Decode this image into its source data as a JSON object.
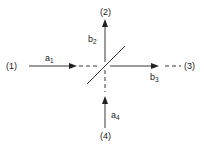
{
  "diagram": {
    "ports": [
      {
        "id": "port-1",
        "label": "(1)"
      },
      {
        "id": "port-2",
        "label": "(2)"
      },
      {
        "id": "port-3",
        "label": "(3)"
      },
      {
        "id": "port-4",
        "label": "(4)"
      }
    ],
    "signals": [
      {
        "id": "a1",
        "base": "a",
        "sub": "1",
        "direction": "input",
        "port": "(1)"
      },
      {
        "id": "b2",
        "base": "b",
        "sub": "2",
        "direction": "output",
        "port": "(2)"
      },
      {
        "id": "b3",
        "base": "b",
        "sub": "3",
        "direction": "output",
        "port": "(3)"
      },
      {
        "id": "a4",
        "base": "a",
        "sub": "4",
        "direction": "input",
        "port": "(4)"
      }
    ],
    "element": "beam-splitter",
    "colors": {
      "stroke": "#222222",
      "background": "#ffffff"
    }
  }
}
